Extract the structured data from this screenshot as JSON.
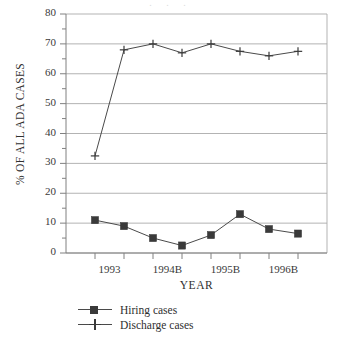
{
  "chart_data": {
    "type": "line",
    "title": "",
    "xlabel": "YEAR",
    "ylabel": "% OF ALL ADA CASES",
    "ylim": [
      0,
      80
    ],
    "ytick_labels": [
      "0",
      "10",
      "20",
      "30",
      "40",
      "50",
      "60",
      "70",
      "80"
    ],
    "ytick_values": [
      0,
      10,
      20,
      30,
      40,
      50,
      60,
      70,
      80
    ],
    "yminor_values": [
      5,
      15,
      25,
      35,
      45,
      55,
      65,
      75
    ],
    "grid": "horizontal",
    "x": [
      1,
      2,
      3,
      4,
      5,
      6,
      7,
      8
    ],
    "xtick_labels": [
      "1993",
      "1994B",
      "1995B",
      "1996B"
    ],
    "xtick_label_positions": [
      1.5,
      3.5,
      5.5,
      7.5
    ],
    "legend_position": "below-axes-left",
    "series": [
      {
        "name": "Hiring cases",
        "marker": "square",
        "color": "#3a3a3a",
        "values": [
          11,
          9,
          5,
          2.5,
          6,
          13,
          8,
          6.5
        ]
      },
      {
        "name": "Discharge cases",
        "marker": "plus",
        "color": "#3a3a3a",
        "values": [
          32.5,
          68,
          70,
          67,
          70,
          67.5,
          66,
          67.5
        ]
      }
    ]
  },
  "axes": {
    "y_axis_title": "% OF ALL ADA CASES",
    "x_axis_title": "YEAR"
  },
  "legend": {
    "items": [
      {
        "label": "Hiring cases"
      },
      {
        "label": "Discharge cases"
      }
    ]
  },
  "colors": {
    "line": "#4a4a4a",
    "grid": "#aaaaaa",
    "axis": "#808080",
    "text": "#2f2f2f",
    "background": "#ffffff"
  }
}
